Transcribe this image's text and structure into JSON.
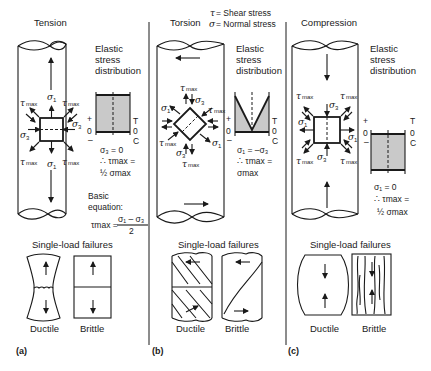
{
  "legend": {
    "tau": "τ",
    "tau_def": " = Shear stress",
    "sigma": "σ",
    "sigma_def": " = Normal stress"
  },
  "common": {
    "elastic_1": "Elastic",
    "elastic_2": "stress",
    "elastic_3": "distribution",
    "single_load": "Single-load failures",
    "ductile": "Ductile",
    "brittle": "Brittle",
    "plus": "+",
    "zero": "0",
    "minus": "–",
    "T": "T",
    "C": "C",
    "tau_max": "τ",
    "max": "max",
    "sigma": "σ",
    "sub1": "1",
    "sub3": "3"
  },
  "panels": [
    {
      "id": "a",
      "title": "Tension",
      "label": "(a)",
      "eq1": "σ₃ = 0",
      "eq2": "∴ τmax =",
      "eq3": "½ σmax",
      "basic_1": "Basic",
      "basic_2": "equation:",
      "basic_lhs": "τmax =",
      "basic_num": "σ₁ – σ₃",
      "basic_den": "2"
    },
    {
      "id": "b",
      "title": "Torsion",
      "label": "(b)",
      "eq1": "σ₁ = –σ₃",
      "eq2": "∴ τmax =",
      "eq3": "σmax"
    },
    {
      "id": "c",
      "title": "Compression",
      "label": "(c)",
      "eq1": "σ₁ = 0",
      "eq2": "∴ τmax =",
      "eq3": "½ σmax"
    }
  ],
  "colors": {
    "ink": "#1a1a1a",
    "shade": "#c9c9c9",
    "background": "#ffffff"
  }
}
